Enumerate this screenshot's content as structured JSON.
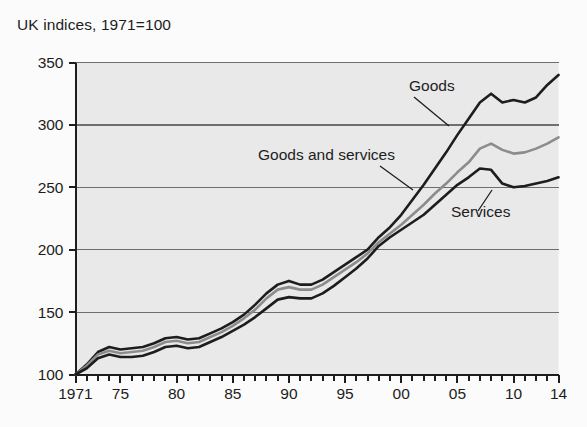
{
  "chart_data": {
    "type": "line",
    "title": "UK indices, 1971=100",
    "subtitle": "",
    "xlabel": "",
    "ylabel": "",
    "xlim": [
      1971,
      2014
    ],
    "ylim": [
      100,
      350
    ],
    "yticks": [
      100,
      150,
      200,
      250,
      300,
      350
    ],
    "ytick_labels": [
      "100",
      "150",
      "200",
      "250",
      "300",
      "350"
    ],
    "xtick_years": [
      1971,
      1975,
      1980,
      1985,
      1990,
      1995,
      2000,
      2005,
      2010,
      2014
    ],
    "xtick_labels": [
      "1971",
      "75",
      "80",
      "85",
      "90",
      "95",
      "00",
      "05",
      "10",
      "14"
    ],
    "minor_tick_interval": 1,
    "grid": true,
    "grid_axis": "y",
    "legend_position": "inline-annotations",
    "plot_background": "#e9e9e9",
    "figure_background": "#fbfbfb",
    "grid_color": "#6e6e6e",
    "axis_color": "#1d1d1d",
    "x": [
      1971,
      1972,
      1973,
      1974,
      1975,
      1976,
      1977,
      1978,
      1979,
      1980,
      1981,
      1982,
      1983,
      1984,
      1985,
      1986,
      1987,
      1988,
      1989,
      1990,
      1991,
      1992,
      1993,
      1994,
      1995,
      1996,
      1997,
      1998,
      1999,
      2000,
      2001,
      2002,
      2003,
      2004,
      2005,
      2006,
      2007,
      2008,
      2009,
      2010,
      2011,
      2012,
      2013,
      2014
    ],
    "series": [
      {
        "name": "Goods",
        "color": "#1d1d1d",
        "width": 2.6,
        "label_anchor": {
          "year": 2004,
          "value": 330
        },
        "values": [
          100,
          108,
          118,
          122,
          120,
          121,
          122,
          125,
          129,
          130,
          128,
          129,
          133,
          137,
          142,
          148,
          156,
          165,
          172,
          175,
          172,
          172,
          176,
          182,
          188,
          194,
          200,
          210,
          218,
          228,
          240,
          252,
          265,
          278,
          292,
          305,
          318,
          325,
          318,
          320,
          318,
          322,
          332,
          340
        ]
      },
      {
        "name": "Goods and services",
        "color": "#8c8c8c",
        "width": 2.6,
        "label_anchor": {
          "year": 1988,
          "value": 277
        },
        "values": [
          100,
          107,
          116,
          119,
          117,
          118,
          119,
          122,
          126,
          127,
          125,
          126,
          130,
          134,
          139,
          145,
          152,
          161,
          168,
          170,
          168,
          168,
          172,
          178,
          184,
          190,
          197,
          206,
          213,
          220,
          228,
          236,
          245,
          253,
          262,
          270,
          281,
          285,
          280,
          277,
          278,
          281,
          285,
          290
        ]
      },
      {
        "name": "Services",
        "color": "#1d1d1d",
        "width": 2.6,
        "label_anchor": {
          "year": 2005,
          "value": 232
        },
        "values": [
          100,
          105,
          113,
          116,
          114,
          114,
          115,
          118,
          122,
          123,
          121,
          122,
          126,
          130,
          135,
          140,
          146,
          153,
          160,
          162,
          161,
          161,
          165,
          171,
          178,
          185,
          193,
          203,
          210,
          216,
          222,
          228,
          236,
          244,
          252,
          258,
          265,
          264,
          253,
          250,
          251,
          253,
          255,
          258
        ]
      }
    ],
    "annotations": [
      {
        "text": "Goods",
        "x": 409,
        "y": 91,
        "leader": {
          "x1": 414,
          "y1": 97,
          "x2": 449,
          "y2": 126
        }
      },
      {
        "text": "Goods and services",
        "x": 258,
        "y": 160,
        "leader": {
          "x1": 380,
          "y1": 166,
          "x2": 413,
          "y2": 190
        }
      },
      {
        "text": "Services",
        "x": 451,
        "y": 217,
        "leader": {
          "x1": 478,
          "y1": 211,
          "x2": 492,
          "y2": 190
        }
      }
    ]
  }
}
